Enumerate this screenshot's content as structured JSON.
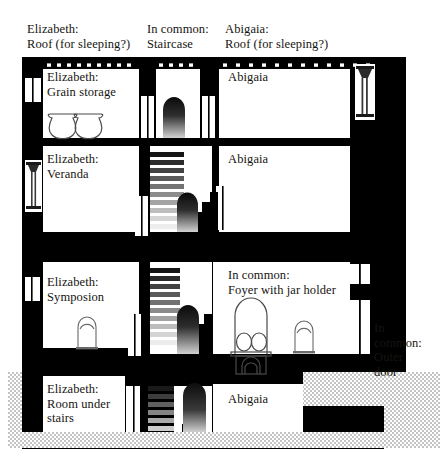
{
  "diagram": {
    "palette": {
      "wall": "#000000",
      "room_fill": "#ffffff",
      "ground": "#d9d9d9",
      "text": "#16140f",
      "arch_dark": "#0b0b0b",
      "arch_light": "#c9c9c9",
      "outline": "#4a4a4a"
    },
    "top_labels": [
      {
        "id": "roof-left",
        "text": "Elizabeth:\nRoof (for sleeping?)",
        "x": 27,
        "y": 22
      },
      {
        "id": "roof-mid",
        "text": "In common:\nStaircase",
        "x": 147,
        "y": 22
      },
      {
        "id": "roof-right",
        "text": "Abigaia:\nRoof (for sleeping?)",
        "x": 225,
        "y": 22
      }
    ],
    "room_labels": [
      {
        "id": "grain-storage",
        "text": "Elizabeth:\nGrain storage",
        "x": 47,
        "y": 70
      },
      {
        "id": "upper-right-1",
        "text": "Abigaia",
        "x": 228,
        "y": 70
      },
      {
        "id": "veranda",
        "text": "Elizabeth:\nVeranda",
        "x": 47,
        "y": 152
      },
      {
        "id": "upper-right-2",
        "text": "Abigaia",
        "x": 228,
        "y": 152
      },
      {
        "id": "symposion",
        "text": "Elizabeth:\nSymposion",
        "x": 47,
        "y": 275
      },
      {
        "id": "foyer",
        "text": "In common:\nFoyer with jar holder",
        "x": 228,
        "y": 268
      },
      {
        "id": "room-under-stairs",
        "text": "Elizabeth:\nRoom under\nstairs",
        "x": 47,
        "y": 382
      },
      {
        "id": "lower-right",
        "text": "Abigaia",
        "x": 228,
        "y": 392
      }
    ],
    "side_labels": [
      {
        "id": "outer-door",
        "text": "In\ncommon:\nOuter\ndoor",
        "x": 374,
        "y": 321
      }
    ]
  }
}
